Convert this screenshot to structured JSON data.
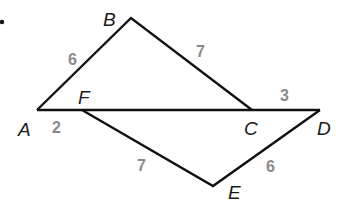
{
  "figure": {
    "bullet": "•",
    "points": {
      "A": {
        "label": "A",
        "x": 37,
        "y": 110
      },
      "B": {
        "label": "B",
        "x": 131,
        "y": 18
      },
      "C": {
        "label": "C",
        "x": 252,
        "y": 110
      },
      "D": {
        "label": "D",
        "x": 320,
        "y": 110
      },
      "E": {
        "label": "E",
        "x": 213,
        "y": 186
      },
      "F": {
        "label": "F",
        "x": 82,
        "y": 110
      }
    },
    "lengths": {
      "AB": "6",
      "BC": "7",
      "AF": "2",
      "CD": "3",
      "FE": "7",
      "ED": "6"
    },
    "colors": {
      "line": "#111111",
      "label": "#1a1a1a",
      "length": "#8a8a8a"
    }
  }
}
